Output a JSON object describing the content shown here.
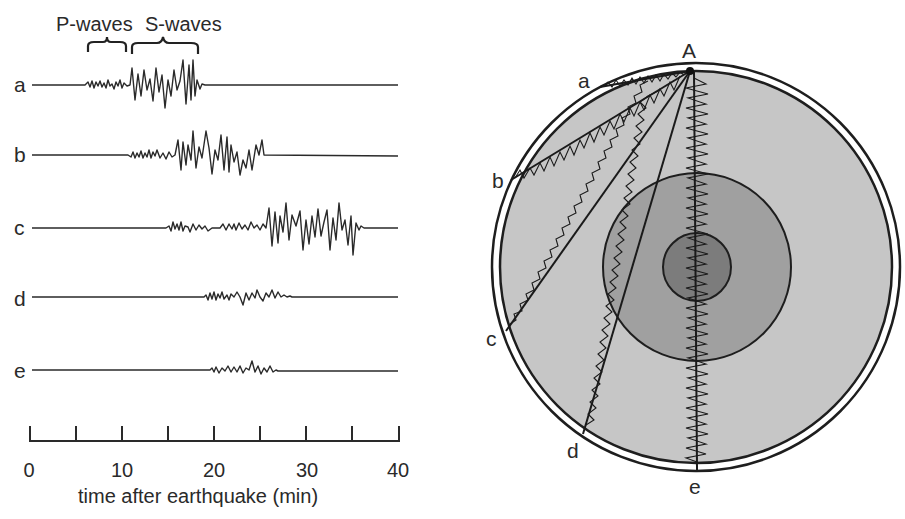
{
  "seismogram": {
    "header": {
      "p_waves": "P-waves",
      "s_waves": "S-waves"
    },
    "traces": [
      {
        "label": "a",
        "p_start_min": 7,
        "s_start_min": 11,
        "end_min": 19
      },
      {
        "label": "b",
        "p_start_min": 11,
        "s_start_min": 16.5,
        "end_min": 25.5
      },
      {
        "label": "c",
        "p_start_min": 15,
        "s_start_min": 25.5,
        "end_min": 36
      },
      {
        "label": "d",
        "p_start_min": 19,
        "s_start_min": null,
        "end_min": 28
      },
      {
        "label": "e",
        "p_start_min": 20,
        "s_start_min": null,
        "end_min": 27
      }
    ],
    "axis": {
      "ticks": [
        "0",
        "10",
        "20",
        "30",
        "40"
      ],
      "minor_ticks": [
        0,
        5,
        10,
        15,
        20,
        25,
        30,
        35,
        40
      ],
      "label": "time after earthquake (min)",
      "range": [
        0,
        40
      ]
    }
  },
  "earth_diagram": {
    "source_label": "A",
    "station_labels": [
      "a",
      "b",
      "c",
      "d",
      "e"
    ],
    "layers": [
      {
        "name": "crust",
        "color": "#ffffff"
      },
      {
        "name": "mantle",
        "color": "#c4c4c4"
      },
      {
        "name": "outer-core",
        "color": "#9c9c9c"
      },
      {
        "name": "inner-core",
        "color": "#7a7a7a"
      }
    ]
  }
}
